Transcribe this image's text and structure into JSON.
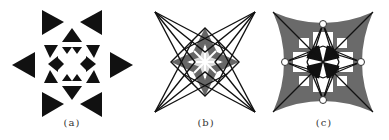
{
  "figures": [
    {
      "id": "a",
      "label": "(a)",
      "description": "Octagonal star pattern of black triangles"
    },
    {
      "id": "b",
      "label": "(b)",
      "description": "Four-pointed line star with grey flower center"
    },
    {
      "id": "c",
      "label": "(c)",
      "description": "Curved four-pointed star with grey fills, black center and ring nodes"
    }
  ],
  "colors": {
    "black": "#111111",
    "grey": "#6e6e6e",
    "background": "#ffffff"
  }
}
